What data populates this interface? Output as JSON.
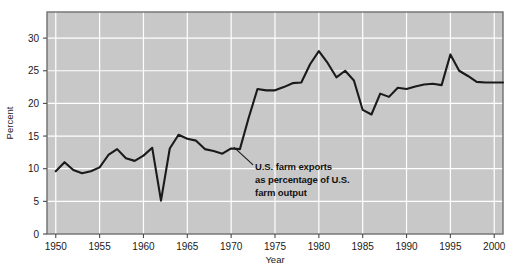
{
  "chart_data": {
    "type": "line",
    "title": "",
    "xlabel": "Year",
    "ylabel": "Percent",
    "xlim": [
      1949,
      2001
    ],
    "ylim": [
      0,
      34
    ],
    "grid": true,
    "legend": null,
    "x_ticks": [
      "1950",
      "1955",
      "1960",
      "1965",
      "1970",
      "1975",
      "1980",
      "1985",
      "1990",
      "1995",
      "2000"
    ],
    "x_tick_values": [
      1950,
      1955,
      1960,
      1965,
      1970,
      1975,
      1980,
      1985,
      1990,
      1995,
      2000
    ],
    "y_ticks": [
      "0",
      "5",
      "10",
      "15",
      "20",
      "25",
      "30"
    ],
    "y_tick_values": [
      0,
      5,
      10,
      15,
      20,
      25,
      30
    ],
    "series": [
      {
        "name": "U.S. farm exports as percentage of U.S. farm output",
        "color": "#1a1a1a",
        "x": [
          1950,
          1951,
          1952,
          1953,
          1954,
          1955,
          1956,
          1957,
          1958,
          1959,
          1960,
          1961,
          1962,
          1963,
          1964,
          1965,
          1966,
          1967,
          1968,
          1969,
          1970,
          1971,
          1972,
          1973,
          1974,
          1975,
          1976,
          1977,
          1978,
          1979,
          1980,
          1981,
          1982,
          1983,
          1984,
          1985,
          1986,
          1987,
          1988,
          1989,
          1990,
          1991,
          1992,
          1993,
          1994,
          1995,
          1996,
          1997,
          1998,
          1999,
          2000,
          2001
        ],
        "values": [
          9.6,
          11.0,
          9.8,
          9.3,
          9.6,
          10.2,
          12.1,
          13.0,
          11.6,
          11.2,
          12.0,
          13.2,
          5.1,
          13.1,
          15.2,
          14.6,
          14.3,
          13.0,
          12.7,
          12.3,
          13.1,
          13.0,
          17.8,
          22.2,
          22.0,
          22.0,
          22.5,
          23.1,
          23.2,
          26.0,
          28.0,
          26.2,
          24.0,
          25.0,
          23.5,
          19.0,
          18.3,
          21.5,
          21.0,
          22.4,
          22.2,
          22.6,
          22.9,
          23.0,
          22.8,
          27.5,
          25.0,
          24.2,
          23.3,
          23.2,
          23.2,
          23.2
        ]
      }
    ],
    "annotations": [
      {
        "name": "series-callout",
        "lines": [
          "U.S. farm exports",
          "as percentage of U.S.",
          "farm output"
        ],
        "leader_from": [
          1970.3,
          13.3
        ],
        "leader_to": [
          1972.5,
          10.6
        ]
      }
    ]
  },
  "figure": {
    "top_clipped_text": "",
    "plot_bg_color": "#c8c8c8",
    "grid_color": "#ffffff",
    "frame_color": "#7a7a7a",
    "line_color": "#1a1a1a",
    "page_bg_color": "#ffffff"
  }
}
